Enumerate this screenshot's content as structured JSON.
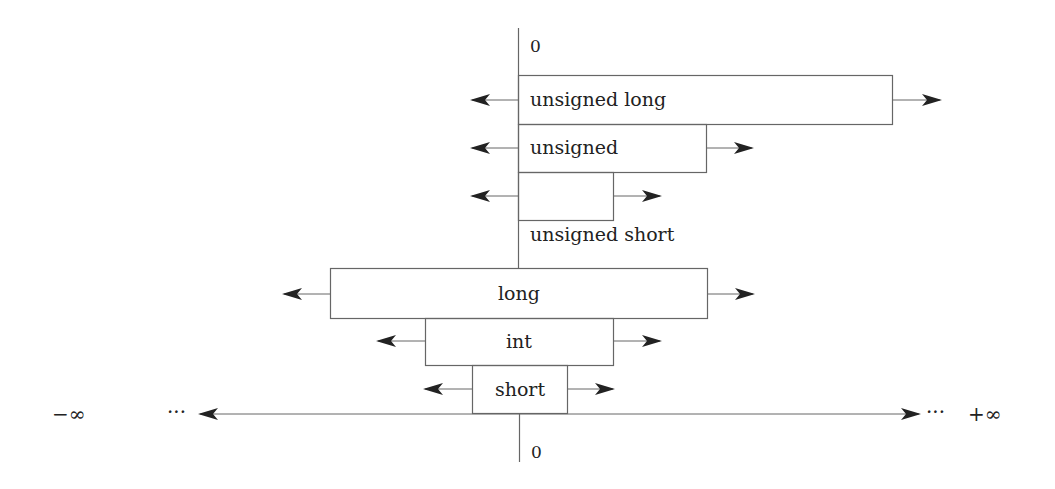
{
  "diagram": {
    "type": "integer-type-range-diagram",
    "axis": {
      "left_label": "−∞",
      "right_label": "+∞",
      "left_ellipsis": "···",
      "right_ellipsis": "···",
      "top_zero": "0",
      "bottom_zero": "0"
    },
    "unsigned_types": [
      {
        "label": "unsigned long",
        "label_position": "inside-left"
      },
      {
        "label": "unsigned",
        "label_position": "inside-left"
      },
      {
        "label": "unsigned short",
        "label_position": "below"
      }
    ],
    "signed_types": [
      {
        "label": "long",
        "label_position": "inside-center"
      },
      {
        "label": "int",
        "label_position": "inside-center"
      },
      {
        "label": "short",
        "label_position": "inside-center"
      }
    ],
    "colors": {
      "line": "#666666",
      "arrow": "#222222",
      "text": "#222222"
    }
  }
}
